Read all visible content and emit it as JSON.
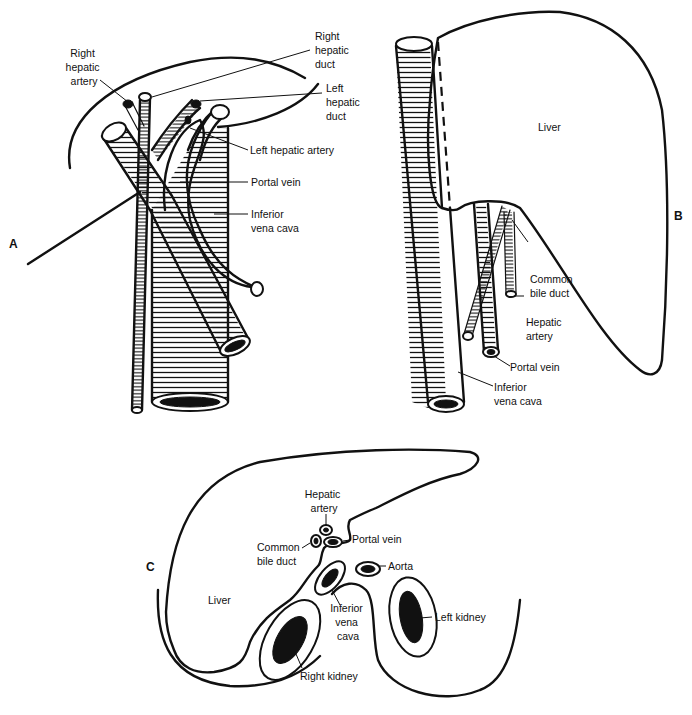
{
  "figure": {
    "panels": {
      "a": {
        "letter": "A",
        "labels": {
          "right_hepatic_artery": [
            "Right",
            "hepatic",
            "artery"
          ],
          "right_hepatic_duct": [
            "Right",
            "hepatic",
            "duct"
          ],
          "left_hepatic_duct": [
            "Left",
            "hepatic",
            "duct"
          ],
          "left_hepatic_artery": "Left hepatic artery",
          "portal_vein": "Portal vein",
          "inferior_vena_cava": [
            "Inferior",
            "vena cava"
          ]
        }
      },
      "b": {
        "letter": "B",
        "labels": {
          "liver": "Liver",
          "common_bile_duct": [
            "Common",
            "bile duct"
          ],
          "hepatic_artery": [
            "Hepatic",
            "artery"
          ],
          "portal_vein": "Portal vein",
          "inferior_vena_cava": [
            "Inferior",
            "vena cava"
          ]
        }
      },
      "c": {
        "letter": "C",
        "labels": {
          "hepatic_artery": [
            "Hepatic",
            "artery"
          ],
          "portal_vein": "Portal vein",
          "common_bile_duct": [
            "Common",
            "bile duct"
          ],
          "aorta": "Aorta",
          "liver": "Liver",
          "inferior_vena_cava": [
            "Inferior",
            "vena",
            "cava"
          ],
          "left_kidney": "Left kidney",
          "right_kidney": "Right kidney"
        }
      }
    }
  }
}
